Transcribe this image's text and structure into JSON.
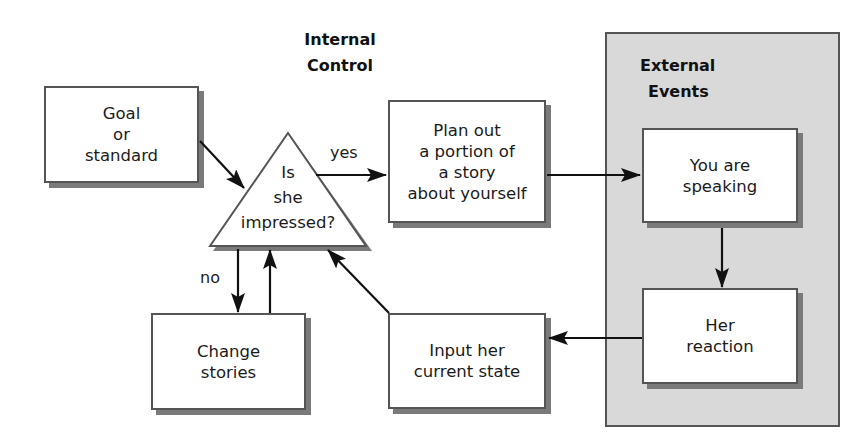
{
  "diagram": {
    "sections": {
      "internal_control": {
        "line1": "Internal",
        "line2": "Control"
      },
      "external_events": {
        "line1": "External",
        "line2": "Events"
      }
    },
    "nodes": {
      "goal": {
        "lines": [
          "Goal",
          "or",
          "standard"
        ]
      },
      "decision": {
        "lines": [
          "Is",
          "she",
          "impressed?"
        ]
      },
      "plan": {
        "lines": [
          "Plan out",
          "a portion of",
          "a story",
          "about yourself"
        ]
      },
      "speaking": {
        "lines": [
          "You are",
          "speaking"
        ]
      },
      "reaction": {
        "lines": [
          "Her",
          "reaction"
        ]
      },
      "input": {
        "lines": [
          "Input her",
          "current state"
        ]
      },
      "change": {
        "lines": [
          "Change",
          "stories"
        ]
      }
    },
    "edge_labels": {
      "yes": "yes",
      "no": "no"
    },
    "edges": [
      {
        "from": "goal",
        "to": "decision"
      },
      {
        "from": "decision",
        "to": "plan",
        "label": "yes"
      },
      {
        "from": "plan",
        "to": "speaking"
      },
      {
        "from": "speaking",
        "to": "reaction"
      },
      {
        "from": "reaction",
        "to": "input"
      },
      {
        "from": "input",
        "to": "decision"
      },
      {
        "from": "decision",
        "to": "change",
        "label": "no"
      },
      {
        "from": "change",
        "to": "decision"
      }
    ],
    "colors": {
      "external_bg": "#d9d9d9",
      "border": "#555555",
      "shadow": "#7a7a7a",
      "arrow": "#111111"
    }
  }
}
